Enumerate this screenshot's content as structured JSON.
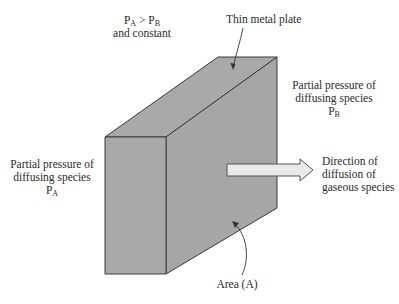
{
  "diagram": {
    "colors": {
      "plate_fill": "#a9a9a9",
      "plate_edge": "#3a3a3a",
      "arrow_fill": "#e9e9e9",
      "arrow_edge": "#555555",
      "text": "#2a2a2a"
    },
    "labels": {
      "condition": {
        "p_a": "P",
        "p_a_sub": "A",
        "gt": " > ",
        "p_b": "P",
        "p_b_sub": "B",
        "line2": "and constant"
      },
      "plate": "Thin metal plate",
      "right_pressure": {
        "line1": "Partial pressure of",
        "line2": "diffusing species",
        "symbol": "P",
        "symbol_sub": "B"
      },
      "left_pressure": {
        "line1": "Partial pressure of",
        "line2": "diffusing species",
        "symbol": "P",
        "symbol_sub": "A"
      },
      "direction": {
        "line1": "Direction of",
        "line2": "diffusion of",
        "line3": "gaseous species"
      },
      "area": "Area (A)"
    }
  }
}
